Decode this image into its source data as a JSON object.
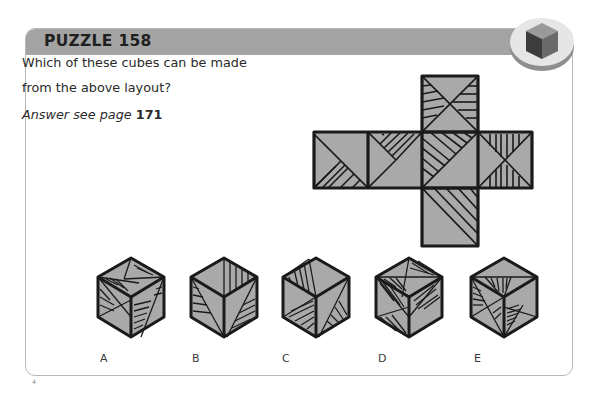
{
  "puzzle": {
    "title": "PUZZLE 158",
    "question": "Which of these cubes can be made from the above layout?",
    "answer_lead": "Answer see page",
    "answer_page": "171"
  },
  "badge": {
    "icon": "cube-icon"
  },
  "colors": {
    "header_band": "#a3a3a3",
    "face_fill": "#a9a9a9",
    "outline": "#1a1a1a",
    "card_border": "#b9b9b9"
  },
  "net": {
    "layout": "cross",
    "faces": [
      {
        "position": "top",
        "pattern": "X diagonals, left and right triangles hatched"
      },
      {
        "position": "left",
        "pattern": "single diagonal, lower-right region hatched"
      },
      {
        "position": "center-left",
        "pattern": "arrow shape, upper wedge hatched"
      },
      {
        "position": "center",
        "pattern": "diagonal, upper-left triangle hatched"
      },
      {
        "position": "right",
        "pattern": "X diagonals, top and bottom triangles vertically hatched"
      },
      {
        "position": "bottom",
        "pattern": "diagonal, upper-right triangle hatched"
      }
    ]
  },
  "options": [
    {
      "label": "A"
    },
    {
      "label": "B"
    },
    {
      "label": "C"
    },
    {
      "label": "D"
    },
    {
      "label": "E"
    }
  ],
  "page_mark": "4"
}
